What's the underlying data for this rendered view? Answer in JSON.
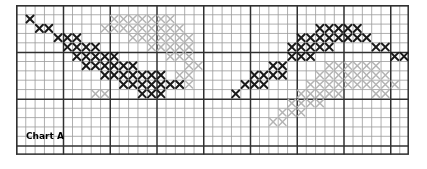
{
  "chart_label": "Chart A",
  "colors": {
    "background": "#ffffff",
    "grid_minor": "#9a9a9a",
    "grid_major": "#303030",
    "stitch_dark": "#1a1a1a",
    "stitch_light": "#b4b4b4",
    "label_text": "#000000"
  },
  "grid": {
    "left": 16,
    "top": 5,
    "cell": 9.35,
    "cols": 42,
    "rows": 16,
    "major_every": 5,
    "minor_width": 0.8,
    "major_width": 1.5
  },
  "label": {
    "x": 26,
    "y": 132,
    "size": 9
  },
  "chart_data": {
    "type": "heatmap",
    "title": "Chart A",
    "xlabel": "",
    "ylabel": "",
    "legend": [
      {
        "name": "dark-stitch",
        "color": "#1a1a1a",
        "symbol": "X"
      },
      {
        "name": "light-stitch",
        "color": "#b4b4b4",
        "symbol": "x"
      }
    ],
    "cols": 42,
    "rows": 16,
    "note": "Cross-stitch pattern chart: cells marked with X symbols in two shades",
    "dark_cells": [
      [
        1,
        1
      ],
      [
        2,
        2
      ],
      [
        3,
        2
      ],
      [
        4,
        3
      ],
      [
        5,
        3
      ],
      [
        6,
        3
      ],
      [
        5,
        4
      ],
      [
        6,
        4
      ],
      [
        7,
        4
      ],
      [
        8,
        4
      ],
      [
        6,
        5
      ],
      [
        7,
        5
      ],
      [
        8,
        5
      ],
      [
        9,
        5
      ],
      [
        10,
        5
      ],
      [
        7,
        6
      ],
      [
        8,
        6
      ],
      [
        9,
        6
      ],
      [
        10,
        6
      ],
      [
        11,
        6
      ],
      [
        12,
        6
      ],
      [
        9,
        7
      ],
      [
        10,
        7
      ],
      [
        11,
        7
      ],
      [
        12,
        7
      ],
      [
        13,
        7
      ],
      [
        14,
        7
      ],
      [
        15,
        7
      ],
      [
        11,
        8
      ],
      [
        12,
        8
      ],
      [
        13,
        8
      ],
      [
        14,
        8
      ],
      [
        15,
        8
      ],
      [
        16,
        8
      ],
      [
        17,
        8
      ],
      [
        13,
        9
      ],
      [
        14,
        9
      ],
      [
        15,
        9
      ],
      [
        23,
        9
      ],
      [
        25,
        7
      ],
      [
        26,
        7
      ],
      [
        27,
        6
      ],
      [
        28,
        6
      ],
      [
        29,
        5
      ],
      [
        30,
        5
      ],
      [
        31,
        5
      ],
      [
        30,
        4
      ],
      [
        31,
        4
      ],
      [
        32,
        4
      ],
      [
        33,
        4
      ],
      [
        31,
        3
      ],
      [
        32,
        3
      ],
      [
        33,
        3
      ],
      [
        34,
        3
      ],
      [
        35,
        3
      ],
      [
        32,
        2
      ],
      [
        33,
        2
      ],
      [
        34,
        2
      ],
      [
        35,
        2
      ],
      [
        36,
        2
      ],
      [
        29,
        4
      ],
      [
        30,
        3
      ],
      [
        36,
        3
      ],
      [
        37,
        3
      ],
      [
        38,
        4
      ],
      [
        39,
        4
      ],
      [
        40,
        5
      ],
      [
        41,
        5
      ],
      [
        24,
        8
      ],
      [
        25,
        8
      ],
      [
        26,
        8
      ],
      [
        27,
        7
      ],
      [
        28,
        7
      ]
    ],
    "light_cells": [
      [
        10,
        1
      ],
      [
        11,
        1
      ],
      [
        12,
        1
      ],
      [
        13,
        1
      ],
      [
        14,
        1
      ],
      [
        15,
        1
      ],
      [
        16,
        1
      ],
      [
        9,
        2
      ],
      [
        10,
        2
      ],
      [
        11,
        2
      ],
      [
        12,
        2
      ],
      [
        13,
        2
      ],
      [
        14,
        2
      ],
      [
        15,
        2
      ],
      [
        16,
        2
      ],
      [
        17,
        2
      ],
      [
        12,
        3
      ],
      [
        13,
        3
      ],
      [
        14,
        3
      ],
      [
        15,
        3
      ],
      [
        16,
        3
      ],
      [
        17,
        3
      ],
      [
        18,
        3
      ],
      [
        14,
        4
      ],
      [
        15,
        4
      ],
      [
        16,
        4
      ],
      [
        17,
        4
      ],
      [
        18,
        4
      ],
      [
        16,
        5
      ],
      [
        17,
        5
      ],
      [
        18,
        5
      ],
      [
        18,
        6
      ],
      [
        19,
        6
      ],
      [
        17,
        7
      ],
      [
        18,
        7
      ],
      [
        16,
        8
      ],
      [
        17,
        8
      ],
      [
        18,
        8
      ],
      [
        33,
        6
      ],
      [
        34,
        6
      ],
      [
        35,
        6
      ],
      [
        36,
        6
      ],
      [
        37,
        6
      ],
      [
        38,
        6
      ],
      [
        32,
        7
      ],
      [
        33,
        7
      ],
      [
        34,
        7
      ],
      [
        35,
        7
      ],
      [
        36,
        7
      ],
      [
        37,
        7
      ],
      [
        38,
        7
      ],
      [
        39,
        7
      ],
      [
        31,
        8
      ],
      [
        32,
        8
      ],
      [
        33,
        8
      ],
      [
        34,
        8
      ],
      [
        35,
        8
      ],
      [
        36,
        8
      ],
      [
        37,
        8
      ],
      [
        38,
        8
      ],
      [
        39,
        8
      ],
      [
        40,
        8
      ],
      [
        30,
        9
      ],
      [
        31,
        9
      ],
      [
        32,
        9
      ],
      [
        33,
        9
      ],
      [
        34,
        9
      ],
      [
        29,
        10
      ],
      [
        30,
        10
      ],
      [
        31,
        10
      ],
      [
        32,
        10
      ],
      [
        28,
        11
      ],
      [
        29,
        11
      ],
      [
        30,
        11
      ],
      [
        27,
        12
      ],
      [
        28,
        12
      ],
      [
        38,
        9
      ],
      [
        39,
        9
      ],
      [
        8,
        9
      ],
      [
        9,
        9
      ]
    ]
  }
}
